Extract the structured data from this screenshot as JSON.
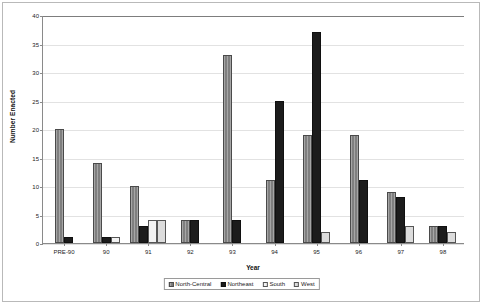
{
  "chart_data": {
    "type": "bar",
    "title": "",
    "xlabel": "Year",
    "ylabel": "Number Enacted",
    "ylim": [
      0,
      40
    ],
    "ytick_step": 5,
    "yticks": [
      0,
      5,
      10,
      15,
      20,
      25,
      30,
      35,
      40
    ],
    "grid": true,
    "legend_position": "bottom",
    "categories": [
      "PRE-90",
      "90",
      "91",
      "92",
      "93",
      "94",
      "95",
      "96",
      "97",
      "98"
    ],
    "series": [
      {
        "name": "North-Central",
        "color": "#7f7f7f",
        "values": [
          20,
          14,
          10,
          4,
          33,
          11,
          19,
          19,
          9,
          3
        ]
      },
      {
        "name": "Northeast",
        "color": "#1c1c1c",
        "values": [
          1,
          1,
          3,
          4,
          4,
          25,
          37,
          11,
          8,
          3
        ]
      },
      {
        "name": "South",
        "color": "#f2f2f2",
        "values": [
          0,
          1,
          4,
          0,
          0,
          0,
          0,
          0,
          0,
          0
        ]
      },
      {
        "name": "West",
        "color": "#dcdcdc",
        "values": [
          0,
          0,
          4,
          0,
          0,
          0,
          2,
          0,
          3,
          2
        ]
      }
    ]
  },
  "legend": {
    "items": [
      {
        "label": "North-Central"
      },
      {
        "label": "Northeast"
      },
      {
        "label": "South"
      },
      {
        "label": "West"
      }
    ]
  }
}
